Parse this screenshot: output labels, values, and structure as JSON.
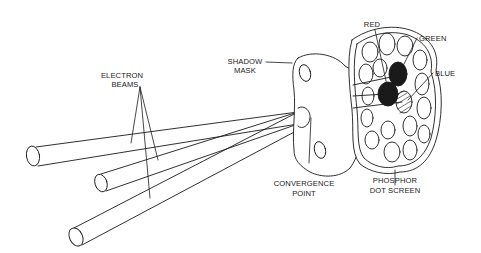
{
  "diagram": {
    "labels": {
      "electron_beams": [
        "ELECTRON",
        "BEAMS"
      ],
      "shadow_mask": [
        "SHADOW",
        "MASK"
      ],
      "convergence_point": [
        "CONVERGENCE",
        "POINT"
      ],
      "phosphor_dot_screen": [
        "PHOSPHOR",
        "DOT SCREEN"
      ],
      "red": "RED",
      "green": "GREEN",
      "blue": "BLUE"
    },
    "components": [
      {
        "id": "electron-gun-1",
        "type": "beam-cylinder"
      },
      {
        "id": "electron-gun-2",
        "type": "beam-cylinder"
      },
      {
        "id": "electron-gun-3",
        "type": "beam-cylinder"
      },
      {
        "id": "shadow-mask",
        "type": "plate-with-holes"
      },
      {
        "id": "phosphor-screen",
        "type": "dot-cluster"
      }
    ],
    "colors": {
      "line": "#1a1a1a",
      "background": "#ffffff"
    }
  }
}
